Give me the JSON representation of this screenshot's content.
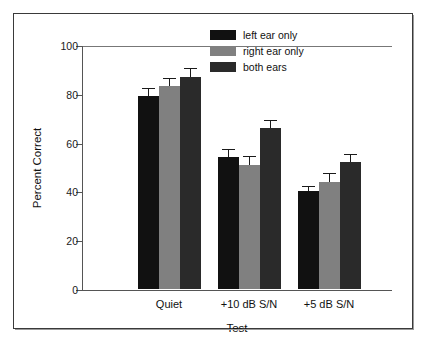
{
  "chart_data": {
    "type": "bar",
    "title": "",
    "xlabel": "Test",
    "ylabel": "Percent Correct",
    "categories": [
      "Quiet",
      "+10 dB S/N",
      "+5 dB S/N"
    ],
    "ylim": [
      0,
      100
    ],
    "yticks": [
      0,
      20,
      40,
      60,
      80,
      100
    ],
    "ytick_labels": [
      "0",
      "20",
      "40",
      "60",
      "80",
      "100"
    ],
    "grid": false,
    "legend_position": "top-right",
    "series": [
      {
        "name": "left ear only",
        "color": "#111111",
        "values": [
          79,
          54,
          40
        ],
        "errors": [
          3,
          3,
          2
        ]
      },
      {
        "name": "right ear only",
        "color": "#808080",
        "values": [
          83,
          51,
          44
        ],
        "errors": [
          3,
          3,
          3
        ]
      },
      {
        "name": "both ears",
        "color": "#2a2a2a",
        "values": [
          87,
          66,
          52
        ],
        "errors": [
          3,
          3,
          3
        ]
      }
    ]
  },
  "legend": {
    "items": [
      {
        "label": "left ear only",
        "color": "#111111"
      },
      {
        "label": "right ear only",
        "color": "#808080"
      },
      {
        "label": "both ears",
        "color": "#2a2a2a"
      }
    ]
  },
  "axes": {
    "y_title": "Percent Correct",
    "x_title": "Test"
  }
}
